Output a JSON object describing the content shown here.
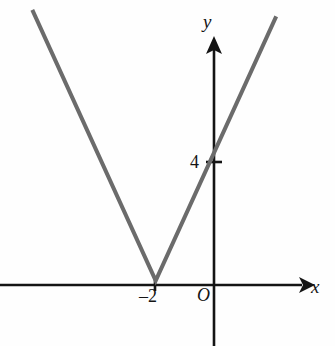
{
  "figure": {
    "width": 335,
    "height": 346,
    "background_color": "#fefefe"
  },
  "axes": {
    "x_axis": {
      "label": "x",
      "color": "#141414",
      "origin_label": "O"
    },
    "y_axis": {
      "label": "y",
      "color": "#141414"
    }
  },
  "ticks": {
    "y_ticks": [
      {
        "label": "4",
        "value": 4
      }
    ],
    "x_ticks": [
      {
        "label": "–2",
        "value": -2
      }
    ]
  },
  "chart_data": {
    "type": "line",
    "title": "",
    "xlabel": "x",
    "ylabel": "y",
    "grid": false,
    "legend": "none",
    "series": [
      {
        "name": "y = 2|x + 2|",
        "color": "#6b6b6b",
        "line_width": 4,
        "points": [
          {
            "x": -6.2,
            "y": 8.3
          },
          {
            "x": -2.0,
            "y": 0.0
          },
          {
            "x": 2.1,
            "y": 8.1
          }
        ]
      }
    ],
    "annotations": [
      {
        "text": "–2",
        "x": -2,
        "y": 0,
        "note": "x-intercept / vertex"
      },
      {
        "text": "4",
        "x": 0,
        "y": 4,
        "note": "y-intercept"
      },
      {
        "text": "O",
        "x": 0,
        "y": 0,
        "note": "origin"
      }
    ],
    "xlim": [
      -7.3,
      4.1
    ],
    "ylim": [
      -2.0,
      8.6
    ]
  }
}
